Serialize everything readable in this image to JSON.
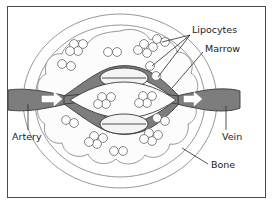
{
  "figure": {
    "border_color": "#4a4a4a",
    "background_color": "#ffffff"
  },
  "colors": {
    "vessel_fill": "#7d7d7d",
    "vessel_stroke": "#3a3a3a",
    "marrow_fill": "#fbfbfb",
    "bone_fill": "#ffffff",
    "outline": "#8a8a8a",
    "label_text": "#1b1b1b",
    "arrow_fill": "#ffffff",
    "cell_stroke": "#6f6f6f"
  },
  "labels": [
    {
      "id": "lipocytes",
      "text": "Lipocytes",
      "x": 192,
      "y": 31,
      "anchor": "start"
    },
    {
      "id": "marrow",
      "text": "Marrow",
      "x": 205,
      "y": 50,
      "anchor": "start"
    },
    {
      "id": "artery",
      "text": "Artery",
      "x": 12,
      "y": 138,
      "anchor": "start"
    },
    {
      "id": "vein",
      "text": "Vein",
      "x": 223,
      "y": 138,
      "anchor": "start"
    },
    {
      "id": "bone",
      "text": "Bone",
      "x": 210,
      "y": 168,
      "anchor": "start"
    }
  ],
  "structures": {
    "bone_outer_circle": {
      "cx": 120,
      "cy": 101,
      "rx": 97,
      "ry": 88
    },
    "bone_inner_circle": {
      "cx": 120,
      "cy": 101,
      "rx": 85,
      "ry": 77
    },
    "marrow_cavity": "scalloped lobed boundary",
    "artery_inlet": {
      "x1": 10,
      "y1": 98,
      "x2": 60,
      "y2": 98
    },
    "vein_outlet": {
      "x1": 182,
      "y1": 98,
      "x2": 232,
      "y2": 98
    },
    "sinusoid_count": 3,
    "arrow_count": 2,
    "lipocyte_cluster_count": 10,
    "lipocyte_pair_count": 4,
    "single_lipocyte_count": 2
  },
  "lipocyte_clusters": [
    {
      "cx": 78,
      "cy": 48,
      "type": "quad"
    },
    {
      "cx": 66,
      "cy": 66,
      "type": "pair"
    },
    {
      "cx": 112,
      "cy": 53,
      "type": "pair"
    },
    {
      "cx": 141,
      "cy": 48,
      "type": "quad"
    },
    {
      "cx": 157,
      "cy": 45,
      "type": "pair"
    },
    {
      "cx": 152,
      "cy": 68,
      "type": "single"
    },
    {
      "cx": 163,
      "cy": 75,
      "type": "single"
    },
    {
      "cx": 106,
      "cy": 100,
      "type": "quad"
    },
    {
      "cx": 146,
      "cy": 99,
      "type": "quad"
    },
    {
      "cx": 70,
      "cy": 122,
      "type": "pair"
    },
    {
      "cx": 160,
      "cy": 120,
      "type": "pair"
    },
    {
      "cx": 152,
      "cy": 137,
      "type": "quad"
    },
    {
      "cx": 98,
      "cy": 140,
      "type": "quad"
    },
    {
      "cx": 118,
      "cy": 152,
      "type": "pair"
    }
  ],
  "leader_lines": {
    "lipocytes_targets": 3,
    "marrow_target": 1,
    "artery_target": 1,
    "vein_target": 1,
    "bone_target": 1
  }
}
